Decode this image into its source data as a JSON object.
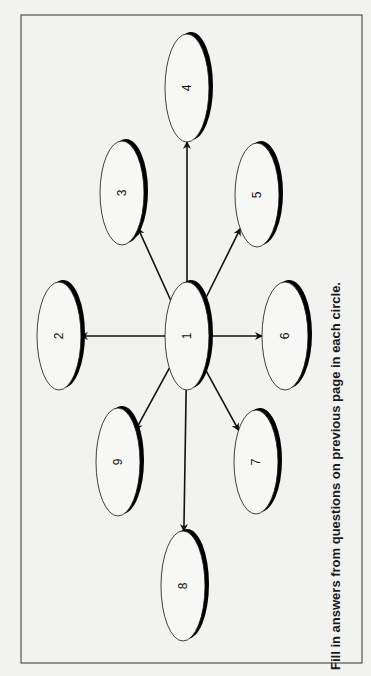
{
  "diagram": {
    "type": "hub-and-spoke",
    "orientation": "rotated -90deg (page in landscape)",
    "frame": {
      "x": 21,
      "y": 15,
      "width": 341,
      "height": 648
    },
    "center_node": "1",
    "nodes": [
      {
        "id": "1",
        "label": "1",
        "cx": 187,
        "cy": 336,
        "rx": 22,
        "ry": 54
      },
      {
        "id": "2",
        "label": "2",
        "cx": 59,
        "cy": 336,
        "rx": 22,
        "ry": 54
      },
      {
        "id": "3",
        "label": "3",
        "cx": 122,
        "cy": 193,
        "rx": 22,
        "ry": 52
      },
      {
        "id": "4",
        "label": "4",
        "cx": 187,
        "cy": 88,
        "rx": 22,
        "ry": 54
      },
      {
        "id": "5",
        "label": "5",
        "cx": 257,
        "cy": 195,
        "rx": 22,
        "ry": 52
      },
      {
        "id": "6",
        "label": "6",
        "cx": 285,
        "cy": 336,
        "rx": 23,
        "ry": 54
      },
      {
        "id": "7",
        "label": "7",
        "cx": 256,
        "cy": 462,
        "rx": 22,
        "ry": 52
      },
      {
        "id": "8",
        "label": "8",
        "cx": 183,
        "cy": 586,
        "rx": 22,
        "ry": 55
      },
      {
        "id": "9",
        "label": "9",
        "cx": 118,
        "cy": 462,
        "rx": 22,
        "ry": 54
      }
    ],
    "edges": [
      {
        "from": "1",
        "to": "2"
      },
      {
        "from": "1",
        "to": "3"
      },
      {
        "from": "1",
        "to": "4"
      },
      {
        "from": "1",
        "to": "5"
      },
      {
        "from": "1",
        "to": "6"
      },
      {
        "from": "1",
        "to": "7"
      },
      {
        "from": "1",
        "to": "8"
      },
      {
        "from": "1",
        "to": "9"
      }
    ],
    "caption": "Fill in answers from questions on previous page in each circle."
  },
  "colors": {
    "background": "#f2f2f0",
    "frame": "#333333",
    "ellipse_fill": "#f7f7f5",
    "stroke": "#111111",
    "shadow": "#000000"
  }
}
